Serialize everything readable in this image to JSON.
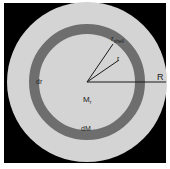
{
  "diagram": {
    "labels": {
      "r_shell": "r",
      "r_shell_sub": "shell",
      "r": "r",
      "R": "R",
      "dr": "dr",
      "M_r": "M",
      "M_r_sub": "r",
      "dM": "dM"
    },
    "colors": {
      "background_frame": "#000000",
      "body_fill": "#d4d4d4",
      "shell_fill": "#6e6e6e",
      "line": "#1a1a1a"
    }
  }
}
